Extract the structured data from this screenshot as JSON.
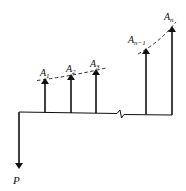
{
  "diagram": {
    "type": "cash-flow-diagram",
    "colors": {
      "ink": "#111111",
      "background": "#ffffff"
    },
    "present_value": {
      "label": "P",
      "direction": "down"
    },
    "receipts": [
      {
        "label_main": "A",
        "label_sub": "1",
        "direction": "up"
      },
      {
        "label_main": "A",
        "label_sub": "2",
        "direction": "up"
      },
      {
        "label_main": "A",
        "label_sub": "3",
        "direction": "up"
      },
      {
        "label_main": "A",
        "label_sub": "n−1",
        "direction": "up"
      },
      {
        "label_main": "A",
        "label_sub": "n",
        "direction": "up"
      }
    ],
    "axis_break": "zigzag",
    "trend_lines": [
      "dashed-growth-curve-left",
      "dashed-growth-curve-right"
    ]
  }
}
